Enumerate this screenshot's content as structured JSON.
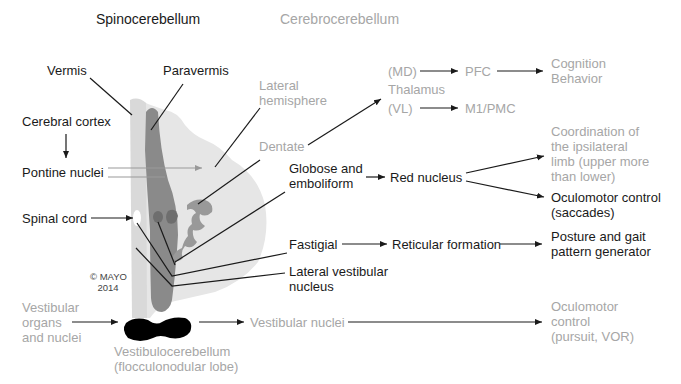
{
  "headers": {
    "spinocerebellum": "Spinocerebellum",
    "cerebrocerebellum": "Cerebrocerebellum"
  },
  "left_labels": {
    "vermis": "Vermis",
    "paravermis": "Paravermis",
    "cerebral_cortex": "Cerebral cortex",
    "pontine_nuclei": "Pontine nuclei",
    "spinal_cord": "Spinal cord",
    "copyright_line1": "© MAYO",
    "copyright_line2": "2014",
    "vestibular_organs": [
      "Vestibular",
      "organs",
      "and nuclei"
    ]
  },
  "cerebellum_labels": {
    "lateral_hemisphere": [
      "Lateral",
      "hemisphere"
    ],
    "dentate": "Dentate",
    "globose_emboliform": [
      "Globose and",
      "emboliform"
    ],
    "fastigial": "Fastigial",
    "lateral_vestibular": [
      "Lateral vestibular",
      "nucleus"
    ],
    "vestibulocerebellum": [
      "Vestibulocerebellum",
      "(flocculonodular lobe)"
    ]
  },
  "pathways": {
    "thalamus": "Thalamus",
    "md": "(MD)",
    "vl": "(VL)",
    "pfc": "PFC",
    "m1pmc": "M1/PMC",
    "cognition": [
      "Cognition",
      "Behavior"
    ],
    "red_nucleus": "Red nucleus",
    "coordination": [
      "Coordination of",
      "the ipsilateral",
      "limb (upper more",
      "than lower)"
    ],
    "oculomotor_saccades": [
      "Oculomotor control",
      "(saccades)"
    ],
    "reticular_formation": "Reticular formation",
    "posture_gait": [
      "Posture and gait",
      "pattern generator"
    ],
    "vestibular_nuclei": "Vestibular nuclei",
    "oculomotor_pursuit": [
      "Oculomotor",
      "control",
      "(pursuit, VOR)"
    ]
  },
  "colors": {
    "dark_text": "#1a1a1a",
    "gray_text": "#a6a6a6",
    "cerebellum_light": "#e6e6e6",
    "vermis_light": "#d9d9d9",
    "paravermis_dark": "#8a8a8a",
    "nuclei": "#999999",
    "flocculus": "#000000"
  }
}
